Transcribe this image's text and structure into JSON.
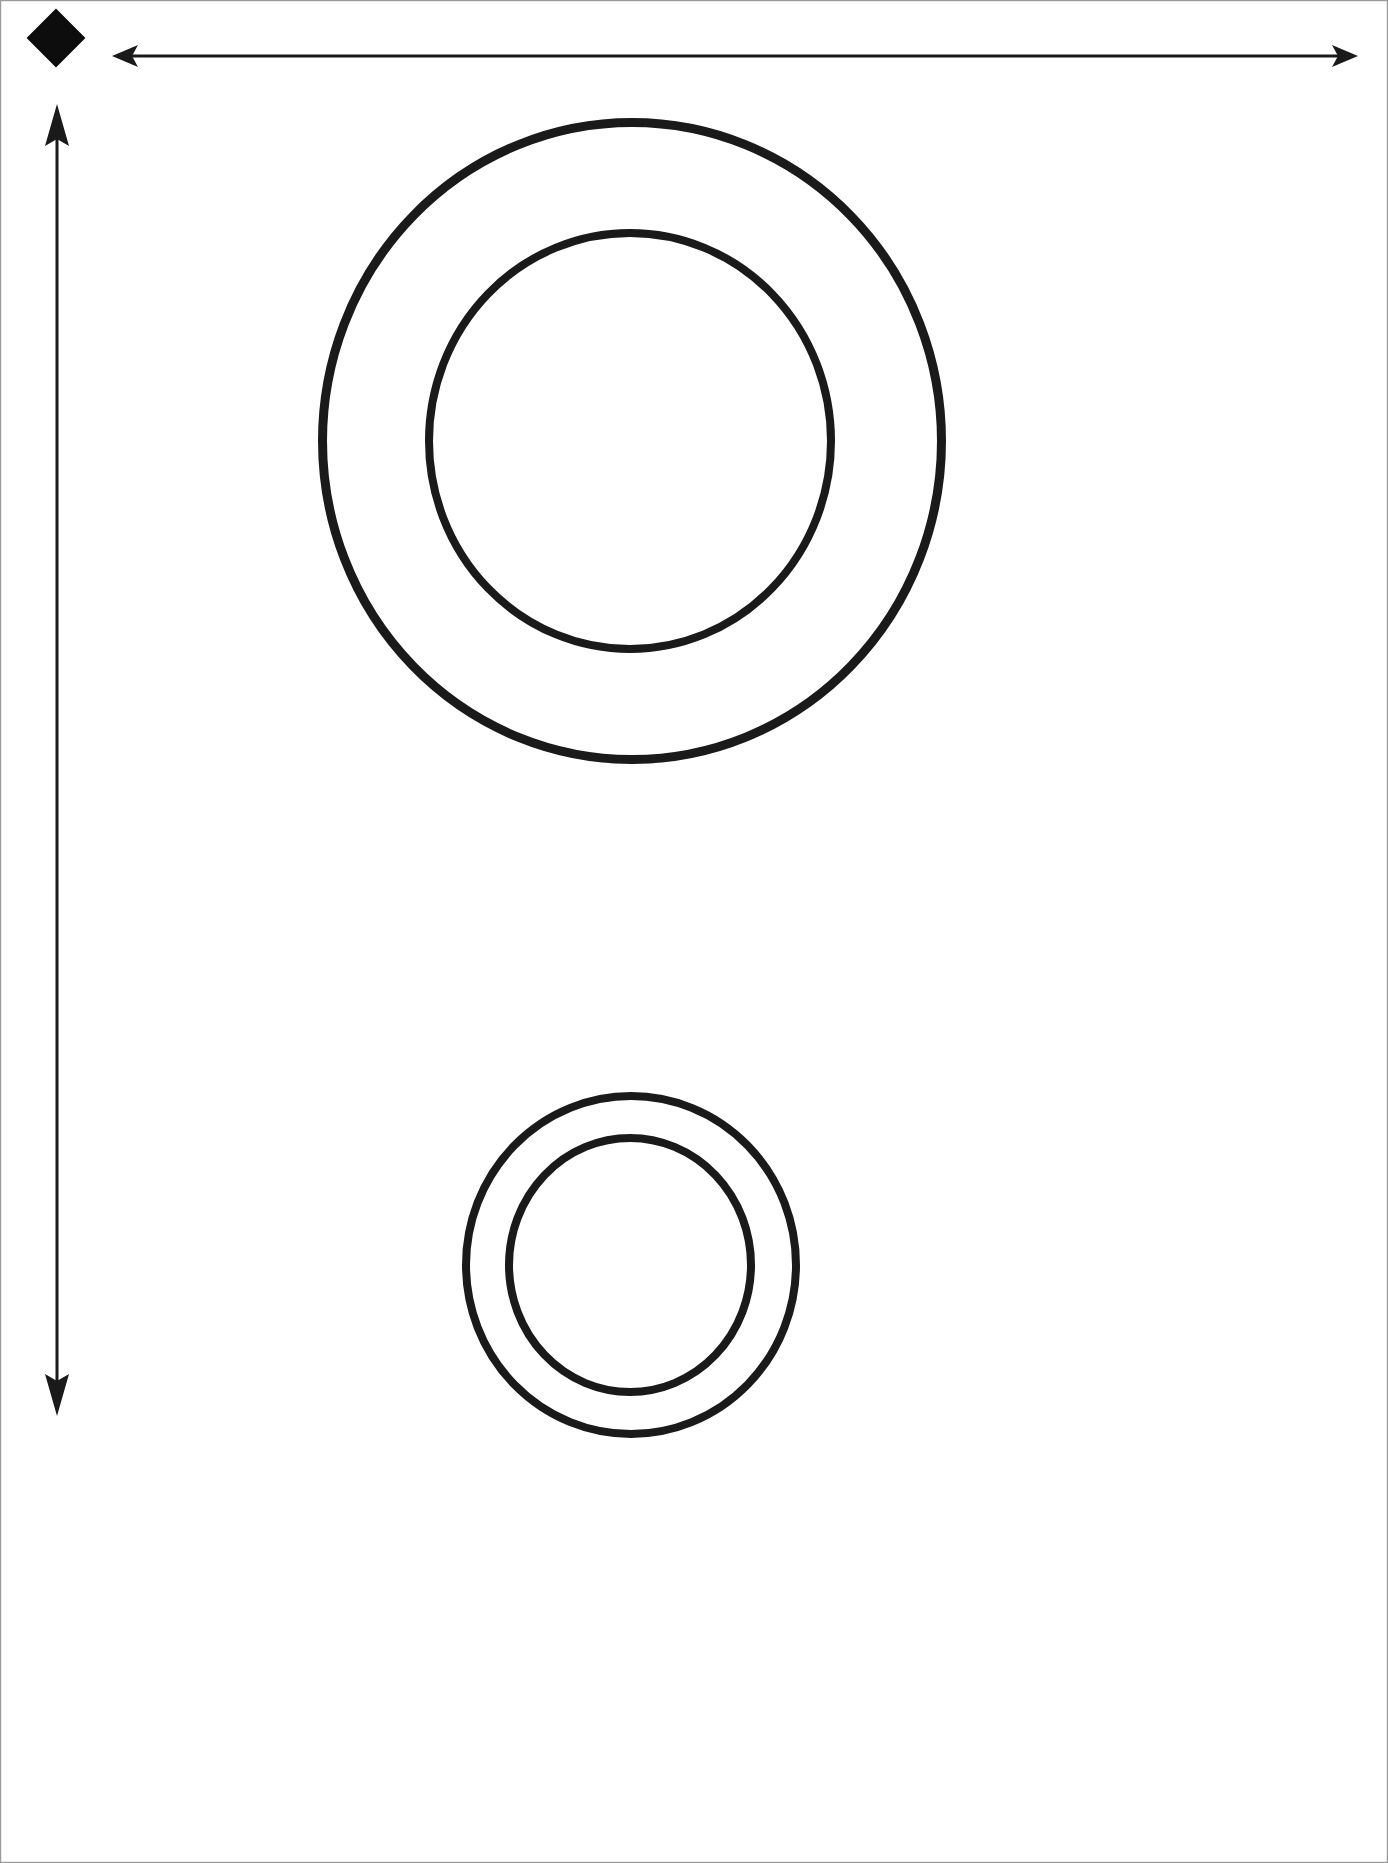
{
  "page": {
    "title": "Annular Ring Pair Technical Line Drawing",
    "width": 1388,
    "height": 1863,
    "background_color": "#ffffff",
    "stroke_color": "#1a1a1a",
    "fill_color": "none",
    "border": {
      "present": true,
      "color": "#9a9a9a",
      "width_px": 1
    }
  },
  "legend": {
    "origin_marker": {
      "shape": "diamond",
      "label": "origin-marker",
      "fill": "#0d0d0d",
      "center_x": 56,
      "center_y": 38,
      "half_diagonal": 28
    }
  },
  "dimensions": {
    "horizontal_arrow": {
      "label": "width-dimension-arrow",
      "orientation": "horizontal",
      "double_headed": true,
      "y": 56,
      "x_start": 112,
      "x_end": 1358,
      "length_px": 1246,
      "stroke_width": 3,
      "head_length": 26,
      "head_half_width": 11
    },
    "vertical_arrow": {
      "label": "height-dimension-arrow",
      "orientation": "vertical",
      "double_headed": true,
      "x": 57,
      "y_start": 104,
      "y_end": 1416,
      "length_px": 1312,
      "stroke_width": 3,
      "head_length": 34,
      "head_half_width": 12
    }
  },
  "shapes": {
    "upper_ring": {
      "label": "upper-concentric-ring",
      "outer": {
        "label": "upper-outer-circle",
        "cx": 632,
        "cy": 441,
        "rx": 314,
        "ry": 323,
        "stroke_width": 9
      },
      "inner": {
        "label": "upper-inner-circle",
        "cx": 630,
        "cy": 441,
        "rx": 205,
        "ry": 212,
        "stroke_width": 8
      }
    },
    "lower_ring": {
      "label": "lower-concentric-ring",
      "outer": {
        "label": "lower-outer-circle",
        "cx": 631,
        "cy": 1265,
        "rx": 169,
        "ry": 173,
        "stroke_width": 8
      },
      "inner": {
        "label": "lower-inner-circle",
        "cx": 630,
        "cy": 1265,
        "rx": 125,
        "ry": 131,
        "stroke_width": 8
      }
    }
  },
  "chart_data": {
    "type": "scatter",
    "title": "Annular Ring Pair Technical Line Drawing",
    "xlabel": "",
    "ylabel": "",
    "xlim": [
      0,
      1388
    ],
    "ylim": [
      0,
      1863
    ],
    "grid": false,
    "legend_position": "none",
    "annotations": [
      "origin diamond marker top-left",
      "horizontal double-headed width arrow",
      "vertical double-headed height arrow"
    ],
    "series": [
      {
        "name": "upper-outer-circle",
        "shape": "ellipse",
        "cx": 632,
        "cy": 441,
        "rx": 314,
        "ry": 323
      },
      {
        "name": "upper-inner-circle",
        "shape": "ellipse",
        "cx": 630,
        "cy": 441,
        "rx": 205,
        "ry": 212
      },
      {
        "name": "lower-outer-circle",
        "shape": "ellipse",
        "cx": 631,
        "cy": 1265,
        "rx": 169,
        "ry": 173
      },
      {
        "name": "lower-inner-circle",
        "shape": "ellipse",
        "cx": 630,
        "cy": 1265,
        "rx": 125,
        "ry": 131
      }
    ]
  }
}
